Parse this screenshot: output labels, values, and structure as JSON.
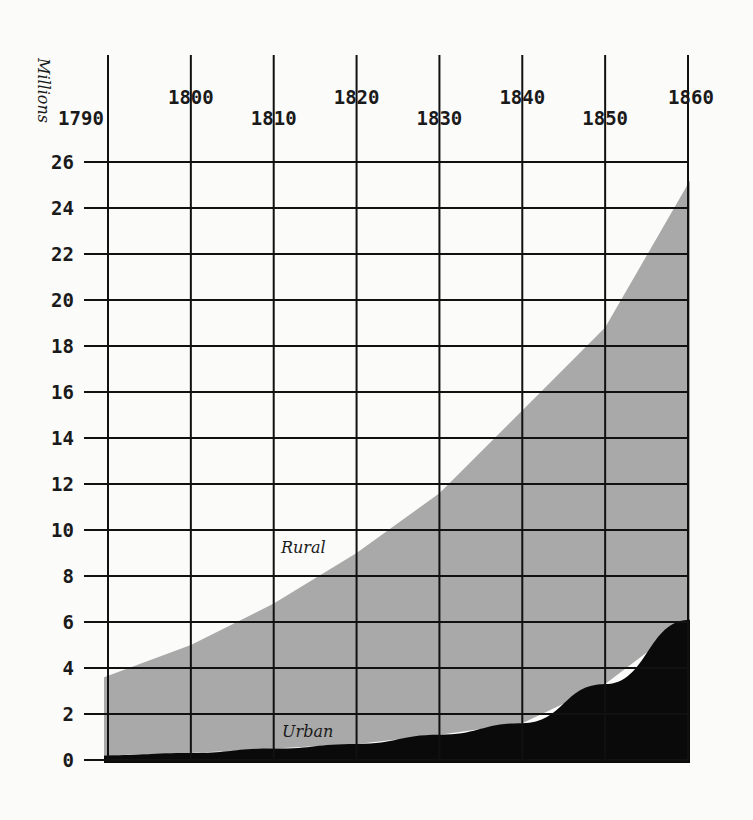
{
  "chart_data": {
    "type": "area",
    "stacked": true,
    "title": "",
    "xlabel": "",
    "ylabel": "Millions",
    "x": [
      1790,
      1800,
      1810,
      1820,
      1830,
      1840,
      1850,
      1860
    ],
    "x_tick_labels": [
      "1790",
      "1800",
      "1810",
      "1820",
      "1830",
      "1840",
      "1850",
      "1860"
    ],
    "y_ticks": [
      0,
      2,
      4,
      6,
      8,
      10,
      12,
      14,
      16,
      18,
      20,
      22,
      24,
      26
    ],
    "y_tick_labels": [
      "0",
      "2",
      "4",
      "6",
      "8",
      "10",
      "12",
      "14",
      "16",
      "18",
      "20",
      "22",
      "24",
      "26"
    ],
    "ylim": [
      0,
      26
    ],
    "xlim": [
      1790,
      1860
    ],
    "grid": true,
    "series": [
      {
        "name": "Urban",
        "label": "Urban",
        "color": "#0a0a0a",
        "values": [
          0.2,
          0.3,
          0.5,
          0.7,
          1.1,
          1.6,
          3.3,
          6.1
        ]
      },
      {
        "name": "Rural",
        "label": "Rural",
        "color": "#a9a9a9",
        "values": [
          3.4,
          4.7,
          6.3,
          8.3,
          10.5,
          13.6,
          15.5,
          19.1
        ]
      }
    ],
    "totals": [
      3.6,
      5.0,
      6.8,
      9.0,
      11.6,
      15.2,
      18.8,
      25.2
    ]
  }
}
